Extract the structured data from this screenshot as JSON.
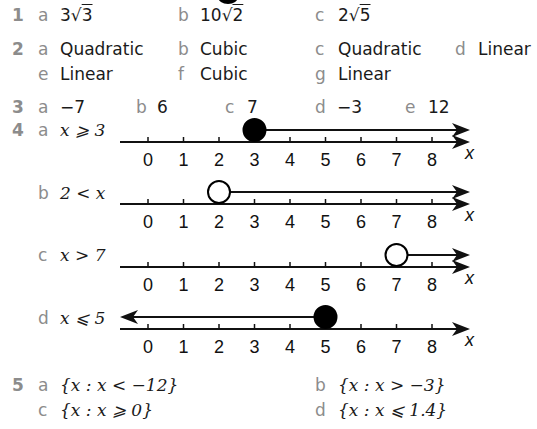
{
  "q1": {
    "number": "1",
    "parts": [
      {
        "label": "a",
        "coef": "3",
        "rad": "3"
      },
      {
        "label": "b",
        "coef": "10",
        "rad": "2"
      },
      {
        "label": "c",
        "coef": "2",
        "rad": "5"
      }
    ]
  },
  "q2": {
    "number": "2",
    "parts": [
      {
        "label": "a",
        "text": "Quadratic"
      },
      {
        "label": "b",
        "text": "Cubic"
      },
      {
        "label": "c",
        "text": "Quadratic"
      },
      {
        "label": "d",
        "text": "Linear"
      },
      {
        "label": "e",
        "text": "Linear"
      },
      {
        "label": "f",
        "text": "Cubic"
      },
      {
        "label": "g",
        "text": "Linear"
      }
    ]
  },
  "q3": {
    "number": "3",
    "parts": [
      {
        "label": "a",
        "text": "−7"
      },
      {
        "label": "b",
        "text": "6"
      },
      {
        "label": "c",
        "text": "7"
      },
      {
        "label": "d",
        "text": "−3"
      },
      {
        "label": "e",
        "text": "12"
      }
    ]
  },
  "q4": {
    "number": "4",
    "axis_label": "x",
    "ticks": [
      "0",
      "1",
      "2",
      "3",
      "4",
      "5",
      "6",
      "7",
      "8"
    ],
    "parts": [
      {
        "label": "a",
        "text": "x ⩾ 3",
        "endpoint": 3,
        "closed": true,
        "direction": "right"
      },
      {
        "label": "b",
        "text": "2 < x",
        "endpoint": 2,
        "closed": false,
        "direction": "right"
      },
      {
        "label": "c",
        "text": "x > 7",
        "endpoint": 7,
        "closed": false,
        "direction": "right"
      },
      {
        "label": "d",
        "text": "x ⩽ 5",
        "endpoint": 5,
        "closed": true,
        "direction": "left"
      }
    ]
  },
  "q5": {
    "number": "5",
    "parts": [
      {
        "label": "a",
        "text": "{x : x < −12}"
      },
      {
        "label": "b",
        "text": "{x : x > −3}"
      },
      {
        "label": "c",
        "text": "{x : x ⩾ 0}"
      },
      {
        "label": "d",
        "text": "{x : x ⩽ 1.4}"
      }
    ]
  }
}
